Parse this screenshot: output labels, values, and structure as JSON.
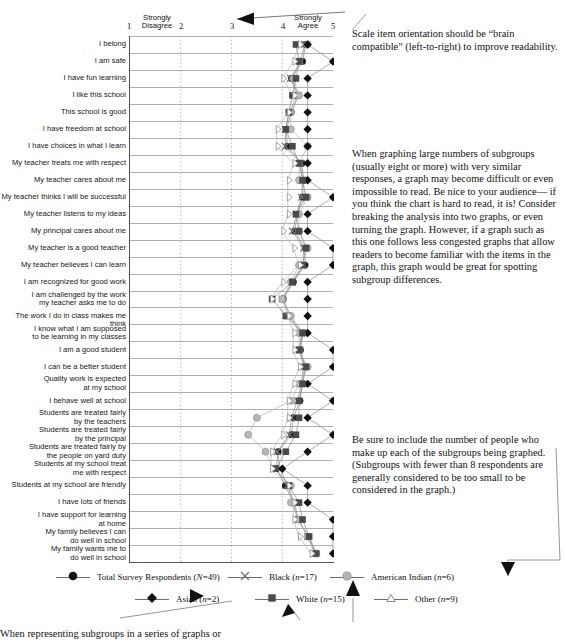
{
  "chart_data": {
    "type": "line",
    "title": "",
    "xlabel": "",
    "ylabel": "",
    "xlim": [
      1,
      5
    ],
    "grid": true,
    "legend_position": "bottom",
    "axis": {
      "ticks": [
        1,
        2,
        3,
        4,
        5
      ],
      "low_anchor_label": "Strongly\nDisagree",
      "high_anchor_label": "Strongly\nAgree",
      "low_anchor_line1": "Strongly",
      "low_anchor_line2": "Disagree",
      "high_anchor_line1": "Strongly",
      "high_anchor_line2": "Agree"
    },
    "categories": [
      "I belong",
      "I am safe",
      "I have fun learning",
      "I like this school",
      "This school is good",
      "I have freedom at school",
      "I have choices in what I learn",
      "My teacher treats me with respect",
      "My teacher cares about me",
      "My teacher thinks I will be successful",
      "My teacher listens to my ideas",
      "My principal cares about me",
      "My teacher is a good teacher",
      "My teacher believes I can learn",
      "I am recognized for good work",
      "I am challenged by the work\nmy teacher asks me to do",
      "The work I do in class makes me think",
      "I know what I am supposed\nto be learning in my classes",
      "I am a good student",
      "I can be a better student",
      "Quality work is expected\nat my school",
      "I behave well at school",
      "Students are treated fairly\nby the teachers",
      "Students are treated fairly\nby the principal",
      "Students are treated fairly by\nthe people on yard duty",
      "Students at my school treat\nme with respect",
      "Students at my school are friendly",
      "I have lots of friends",
      "I have support for learning\nat home",
      "My family believes I can\ndo well in school",
      "My family wants me to\ndo well in school"
    ],
    "series": [
      {
        "name": "Total Survey Respondents (N=49)",
        "label_text": "Total Survey Respondents",
        "n_label": "(N=49)",
        "marker": "filled-circle",
        "color": "#1a1a1a",
        "values": [
          4.46,
          4.4,
          4.18,
          4.32,
          4.18,
          4.08,
          4.1,
          4.39,
          4.42,
          4.4,
          4.3,
          4.24,
          4.45,
          4.45,
          4.22,
          4.02,
          4.16,
          4.41,
          4.36,
          4.44,
          4.4,
          4.35,
          4.22,
          4.18,
          3.92,
          3.88,
          4.06,
          4.22,
          4.3,
          4.52,
          4.66
        ]
      },
      {
        "name": "Black (n=17)",
        "label_text": "Black",
        "n_label": "(n=17)",
        "marker": "x-cross",
        "color": "#7a7a7a",
        "values": [
          4.44,
          4.36,
          4.16,
          4.3,
          4.14,
          4.06,
          4.06,
          4.36,
          4.4,
          4.38,
          4.28,
          4.2,
          4.42,
          4.42,
          4.2,
          4.0,
          4.12,
          4.38,
          4.34,
          4.42,
          4.38,
          4.3,
          4.18,
          4.14,
          3.9,
          3.96,
          4.1,
          4.24,
          4.32,
          4.5,
          4.64
        ]
      },
      {
        "name": "American Indian (n=6)",
        "label_text": "American Indian",
        "n_label": "(n=6)",
        "marker": "gray-circle",
        "color": "#a9a9a9",
        "values": [
          4.5,
          4.33,
          4.22,
          4.33,
          4.17,
          4.17,
          4.5,
          4.33,
          4.33,
          4.5,
          4.33,
          4.33,
          4.5,
          4.33,
          4.17,
          4.0,
          4.17,
          4.33,
          4.33,
          4.5,
          4.33,
          4.17,
          3.5,
          3.33,
          3.67,
          3.83,
          4.17,
          4.17,
          4.33,
          4.5,
          4.67
        ]
      },
      {
        "name": "Asian (n=2)",
        "label_text": "Asian",
        "n_label": "(n=2)",
        "marker": "filled-diamond",
        "color": "#101010",
        "values": [
          4.5,
          5.0,
          4.5,
          4.5,
          4.5,
          4.5,
          4.5,
          4.5,
          4.5,
          5.0,
          4.5,
          4.5,
          5.0,
          5.0,
          4.5,
          4.5,
          4.5,
          4.5,
          5.0,
          5.0,
          4.5,
          5.0,
          4.5,
          5.0,
          4.5,
          4.0,
          4.5,
          4.5,
          5.0,
          5.0,
          5.0
        ]
      },
      {
        "name": "White (n=15)",
        "label_text": "White",
        "n_label": "(n=15)",
        "marker": "filled-square",
        "color": "#4a4a4a",
        "values": [
          4.27,
          4.33,
          4.27,
          4.2,
          4.13,
          4.07,
          4.2,
          4.33,
          4.4,
          4.47,
          4.27,
          4.33,
          4.47,
          4.4,
          4.2,
          3.8,
          4.07,
          4.4,
          4.33,
          4.47,
          4.4,
          4.33,
          4.33,
          4.27,
          4.07,
          3.87,
          4.13,
          4.33,
          4.4,
          4.53,
          4.67
        ]
      },
      {
        "name": "Other (n=9)",
        "label_text": "Other",
        "n_label": "(n=9)",
        "marker": "open-triangle",
        "color": "#9a9a9a",
        "values": [
          4.33,
          4.22,
          4.0,
          4.22,
          4.11,
          3.89,
          3.89,
          4.22,
          4.11,
          4.11,
          4.11,
          4.0,
          4.22,
          4.33,
          4.0,
          3.78,
          4.11,
          4.22,
          4.22,
          4.33,
          4.22,
          4.11,
          4.11,
          4.0,
          3.78,
          3.78,
          4.11,
          4.22,
          4.22,
          4.33,
          4.56
        ]
      }
    ]
  },
  "notes": {
    "note_1": "Scale item orientation should be “brain compatible” (left-to-right) to improve readability.",
    "note_2": "When graphing large numbers of subgroups (usually eight or more) with very similar responses, a graph may become difficult or even impossible to read. Be nice to your audience— if you think the chart is hard to read, it is! Consider breaking the analysis into two graphs, or even turning the graph. However, if a graph such as this one follows less congested graphs that allow readers to become familiar with the items in the graph, this graph would be great for spotting subgroup differences.",
    "note_3": "Be sure to include the number of people who make up each of the subgroups being graphed. (Subgroups with fewer than 8 respondents are generally considered to be too small to be considered in the graph.)",
    "note_4": "When representing subgroups in a series of graphs or"
  }
}
